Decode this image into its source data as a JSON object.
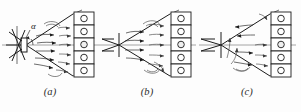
{
  "figure": {
    "title": "",
    "background_color": "#fdfdfd",
    "ink_color": "#1c1c1c",
    "centerline_color": "#8e8e8e",
    "panel_count": 3,
    "grid_cell_count": 5,
    "angle_symbol": "α"
  },
  "panels": [
    {
      "id": "a",
      "caption": "(a)",
      "angle_label": "α",
      "has_angle_label": true,
      "nozzle_name": "spray-nozzle",
      "target_name": "collector-grid",
      "cells": [
        "○",
        "○",
        "○",
        "○",
        "○"
      ],
      "highlight_cell_index": 2
    },
    {
      "id": "b",
      "caption": "(b)",
      "angle_label": "",
      "has_angle_label": false,
      "nozzle_name": "spray-nozzle",
      "target_name": "collector-grid",
      "cells": [
        "○",
        "○",
        "○",
        "○",
        "○"
      ],
      "highlight_cell_index": 2
    },
    {
      "id": "c",
      "caption": "(c)",
      "angle_label": "",
      "has_angle_label": false,
      "nozzle_name": "spray-nozzle",
      "target_name": "collector-grid",
      "cells": [
        "○",
        "○",
        "○",
        "○",
        "○"
      ],
      "highlight_cell_index": 2
    }
  ]
}
